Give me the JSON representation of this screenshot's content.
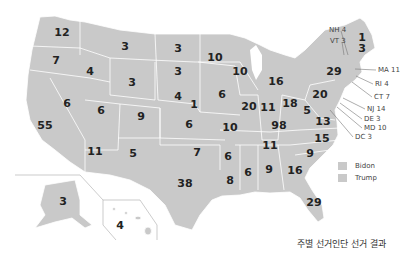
{
  "map": {
    "title": "주별 선거인단 선거 결과",
    "fill_color": "#c9c9c9",
    "border_color": "#ffffff",
    "states": [
      {
        "name": "WA",
        "votes": "12",
        "x": 62,
        "y": 32
      },
      {
        "name": "OR",
        "votes": "7",
        "x": 56,
        "y": 60
      },
      {
        "name": "ID",
        "votes": "4",
        "x": 90,
        "y": 71
      },
      {
        "name": "MT",
        "votes": "3",
        "x": 125,
        "y": 46
      },
      {
        "name": "WY",
        "votes": "3",
        "x": 132,
        "y": 82
      },
      {
        "name": "ND",
        "votes": "3",
        "x": 178,
        "y": 48
      },
      {
        "name": "SD",
        "votes": "3",
        "x": 178,
        "y": 71
      },
      {
        "name": "NE",
        "votes": "4",
        "x": 178,
        "y": 96
      },
      {
        "name": "NE-2",
        "votes": "1",
        "x": 194,
        "y": 104
      },
      {
        "name": "MN",
        "votes": "10",
        "x": 215,
        "y": 57
      },
      {
        "name": "WI",
        "votes": "10",
        "x": 240,
        "y": 71
      },
      {
        "name": "MI",
        "votes": "16",
        "x": 276,
        "y": 81
      },
      {
        "name": "IA",
        "votes": "6",
        "x": 222,
        "y": 94
      },
      {
        "name": "IL",
        "votes": "20",
        "x": 249,
        "y": 106
      },
      {
        "name": "IN",
        "votes": "11",
        "x": 268,
        "y": 107
      },
      {
        "name": "OH",
        "votes": "18",
        "x": 290,
        "y": 103
      },
      {
        "name": "PA",
        "votes": "20",
        "x": 320,
        "y": 94
      },
      {
        "name": "NY",
        "votes": "29",
        "x": 334,
        "y": 71
      },
      {
        "name": "ME",
        "votes": "1",
        "x": 362,
        "y": 37
      },
      {
        "name": "ME-2",
        "votes": "3",
        "x": 362,
        "y": 48
      },
      {
        "name": "NV",
        "votes": "6",
        "x": 67,
        "y": 103
      },
      {
        "name": "UT",
        "votes": "6",
        "x": 101,
        "y": 110
      },
      {
        "name": "CO",
        "votes": "9",
        "x": 141,
        "y": 116
      },
      {
        "name": "KS",
        "votes": "6",
        "x": 189,
        "y": 124
      },
      {
        "name": "MO",
        "votes": "10",
        "x": 230,
        "y": 127
      },
      {
        "name": "KY",
        "votes": "98",
        "x": 279,
        "y": 125
      },
      {
        "name": "WV",
        "votes": "5",
        "x": 307,
        "y": 110
      },
      {
        "name": "VA",
        "votes": "13",
        "x": 323,
        "y": 121
      },
      {
        "name": "CA",
        "votes": "55",
        "x": 45,
        "y": 125
      },
      {
        "name": "AZ",
        "votes": "11",
        "x": 95,
        "y": 151
      },
      {
        "name": "NM",
        "votes": "5",
        "x": 133,
        "y": 153
      },
      {
        "name": "OK",
        "votes": "7",
        "x": 197,
        "y": 152
      },
      {
        "name": "TN",
        "votes": "11",
        "x": 270,
        "y": 145
      },
      {
        "name": "NC",
        "votes": "15",
        "x": 322,
        "y": 138
      },
      {
        "name": "SC",
        "votes": "9",
        "x": 310,
        "y": 153
      },
      {
        "name": "AR",
        "votes": "6",
        "x": 228,
        "y": 156
      },
      {
        "name": "MS",
        "votes": "6",
        "x": 248,
        "y": 172
      },
      {
        "name": "AL",
        "votes": "9",
        "x": 269,
        "y": 169
      },
      {
        "name": "GA",
        "votes": "16",
        "x": 295,
        "y": 170
      },
      {
        "name": "LA",
        "votes": "8",
        "x": 230,
        "y": 180
      },
      {
        "name": "TX",
        "votes": "38",
        "x": 185,
        "y": 183
      },
      {
        "name": "FL",
        "votes": "29",
        "x": 314,
        "y": 202
      },
      {
        "name": "AK",
        "votes": "3",
        "x": 63,
        "y": 201
      },
      {
        "name": "HI",
        "votes": "4",
        "x": 120,
        "y": 225
      }
    ],
    "callouts": [
      {
        "label": "NH 4",
        "x": 329,
        "y": 30
      },
      {
        "label": "VT 3",
        "x": 330,
        "y": 41
      },
      {
        "label": "MA 11",
        "x": 378,
        "y": 70
      },
      {
        "label": "RI 4",
        "x": 375,
        "y": 84
      },
      {
        "label": "CT 7",
        "x": 374,
        "y": 97
      },
      {
        "label": "NJ 14",
        "x": 367,
        "y": 109
      },
      {
        "label": "DE 3",
        "x": 364,
        "y": 119
      },
      {
        "label": "MD 10",
        "x": 364,
        "y": 128
      },
      {
        "label": "DC 3",
        "x": 355,
        "y": 137
      }
    ]
  },
  "legend": {
    "items": [
      {
        "label": "Bidon",
        "color": "#c9c9c9"
      },
      {
        "label": "Trump",
        "color": "#c9c9c9"
      }
    ]
  }
}
